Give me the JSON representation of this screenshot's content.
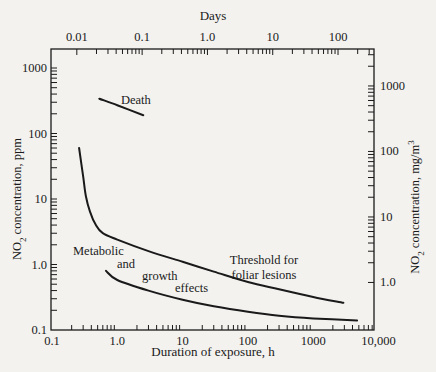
{
  "chart_data": {
    "type": "line",
    "title": "",
    "xlabel": "Duration of exposure, h",
    "x2label": "Days",
    "ylabel_left": "NO2 concentration, ppm",
    "ylabel_right": "NO2 concentration, mg/m3",
    "x_scale": "log",
    "y_scale": "log",
    "xlim": [
      0.1,
      10000
    ],
    "ylim": [
      0.1,
      1000
    ],
    "grid": false,
    "x_ticks": [
      "0.1",
      "1.0",
      "10",
      "100",
      "1000",
      "10,000"
    ],
    "x_tick_values": [
      0.1,
      1,
      10,
      100,
      1000,
      10000
    ],
    "x2_ticks": [
      "0.01",
      "0.1",
      "1.0",
      "10",
      "100"
    ],
    "x2_tick_values_days": [
      0.01,
      0.1,
      1,
      10,
      100
    ],
    "y_ticks_left": [
      "0.1",
      "1.0",
      "10",
      "100",
      "1000"
    ],
    "y_tick_values_left": [
      0.1,
      1,
      10,
      100,
      1000
    ],
    "y_ticks_right": [
      "1.0",
      "10",
      "100",
      "1000"
    ],
    "y_tick_values_right_mg_m3": [
      1,
      10,
      100,
      1000
    ],
    "series": [
      {
        "name": "Death",
        "x": [
          0.53,
          1.0,
          2.5
        ],
        "y": [
          340,
          270,
          190
        ]
      },
      {
        "name": "Threshold for foliar lesions",
        "x": [
          0.26,
          0.3,
          0.33,
          0.38,
          0.47,
          0.6,
          1.0,
          3.0,
          10,
          30,
          100,
          300,
          1000,
          2900
        ],
        "y": [
          60,
          22,
          11,
          6.5,
          4.0,
          3.0,
          2.4,
          1.6,
          1.1,
          0.78,
          0.54,
          0.42,
          0.32,
          0.26
        ]
      },
      {
        "name": "Metabolic and growth effects",
        "x": [
          0.67,
          1.0,
          3.0,
          10,
          30,
          100,
          300,
          1000,
          4700
        ],
        "y": [
          0.8,
          0.58,
          0.4,
          0.29,
          0.23,
          0.19,
          0.165,
          0.15,
          0.14
        ]
      }
    ],
    "annotations": [
      {
        "text": "Death",
        "x": 1.4,
        "y": 330
      },
      {
        "text": "Threshold for foliar lesions",
        "x": 300,
        "y": 1.2
      },
      {
        "text": "Metabolic and growth effects",
        "x": 3,
        "y": 0.5
      }
    ]
  },
  "labels": {
    "days": "Days",
    "xlabel": "Duration of exposure, h",
    "ylabel_left_prefix": "NO",
    "ylabel_left_sub": "2",
    "ylabel_left_suffix": " concentration, ppm",
    "ylabel_right_prefix": "NO",
    "ylabel_right_sub": "2",
    "ylabel_right_suffix": " concentration, mg/m",
    "ylabel_right_sup": "3",
    "death": "Death",
    "threshold_1": "Threshold for",
    "threshold_2": "foliar lesions",
    "metabolic": "Metabolic",
    "and": "and",
    "growth": "growth",
    "effects": "effects"
  },
  "colors": {
    "background": "#f3f2ef",
    "ink": "#1a1a1a"
  }
}
